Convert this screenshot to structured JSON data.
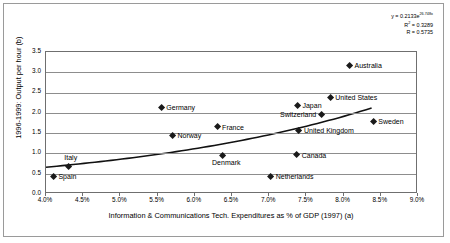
{
  "annotation": {
    "equation_prefix": "y = 0.2133e",
    "equation_exponent": "26.748x",
    "r_squared_label": "R",
    "r_squared_sup": "2",
    "r_squared_value": " = 0.3289",
    "r_label": "R = 0.5735"
  },
  "chart_data": {
    "type": "scatter",
    "title": "",
    "xlabel": "Information & Communications Tech. Expenditures as % of GDP (1997) (a)",
    "ylabel": "1996-1999: Output per hour (b)",
    "xlim": [
      4.0,
      9.0
    ],
    "ylim": [
      0.0,
      3.5
    ],
    "xtick_labels": [
      "4.0%",
      "4.5%",
      "5.0%",
      "5.5%",
      "6.0%",
      "6.5%",
      "7.0%",
      "7.5%",
      "8.0%",
      "8.5%",
      "9.0%"
    ],
    "xtick_values": [
      4.0,
      4.5,
      5.0,
      5.5,
      6.0,
      6.5,
      7.0,
      7.5,
      8.0,
      8.5,
      9.0
    ],
    "ytick_labels": [
      "0.0",
      "0.5",
      "1.0",
      "1.5",
      "2.0",
      "2.5",
      "3.0",
      "3.5"
    ],
    "ytick_values": [
      0.0,
      0.5,
      1.0,
      1.5,
      2.0,
      2.5,
      3.0,
      3.5
    ],
    "grid": "horizontal",
    "legend": "none",
    "points": [
      {
        "label": "Australia",
        "x": 8.08,
        "y": 3.16,
        "label_pos": "right"
      },
      {
        "label": "United States",
        "x": 7.82,
        "y": 2.38,
        "label_pos": "right"
      },
      {
        "label": "Japan",
        "x": 7.38,
        "y": 2.17,
        "label_pos": "right"
      },
      {
        "label": "Germany",
        "x": 5.55,
        "y": 2.14,
        "label_pos": "right"
      },
      {
        "label": "Switzerland",
        "x": 7.7,
        "y": 1.95,
        "label_pos": "left"
      },
      {
        "label": "Sweden",
        "x": 8.4,
        "y": 1.78,
        "label_pos": "right"
      },
      {
        "label": "France",
        "x": 6.3,
        "y": 1.65,
        "label_pos": "right"
      },
      {
        "label": "United Kingdom",
        "x": 7.4,
        "y": 1.56,
        "label_pos": "right"
      },
      {
        "label": "Norway",
        "x": 5.7,
        "y": 1.43,
        "label_pos": "right"
      },
      {
        "label": "Canada",
        "x": 7.37,
        "y": 0.96,
        "label_pos": "right"
      },
      {
        "label": "Denmark",
        "x": 6.38,
        "y": 0.95,
        "label_pos": "below"
      },
      {
        "label": "Italy",
        "x": 4.3,
        "y": 0.68,
        "label_pos": "above"
      },
      {
        "label": "Netherlands",
        "x": 7.02,
        "y": 0.44,
        "label_pos": "right"
      },
      {
        "label": "Spain",
        "x": 4.1,
        "y": 0.42,
        "label_pos": "right"
      }
    ],
    "trendline": {
      "type": "exponential",
      "a": 0.2133,
      "b": 26.748,
      "x_start": 4.0,
      "x_end": 8.4,
      "y_start": 0.62,
      "y_end": 2.1
    }
  }
}
